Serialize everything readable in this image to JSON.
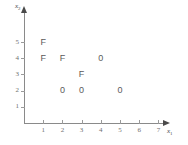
{
  "chart_data": {
    "type": "scatter",
    "title": "",
    "xlabel": "x1",
    "ylabel": "x2",
    "xlim": [
      0,
      7.6
    ],
    "ylim": [
      0,
      5.8
    ],
    "grid": false,
    "legend": "none",
    "x_ticks": [
      "1",
      "2",
      "3",
      "4",
      "5",
      "6",
      "7"
    ],
    "y_ticks": [
      "1",
      "2",
      "3",
      "4",
      "5"
    ],
    "x_tick_values": [
      1,
      2,
      3,
      4,
      5,
      6,
      7
    ],
    "y_tick_values": [
      1,
      2,
      3,
      4,
      5
    ],
    "series": [
      {
        "name": "F",
        "marker_label": "F",
        "points": [
          {
            "x": 1,
            "y": 5
          },
          {
            "x": 1,
            "y": 4
          },
          {
            "x": 2,
            "y": 4
          },
          {
            "x": 3,
            "y": 3
          }
        ]
      },
      {
        "name": "0",
        "marker_label": "0",
        "points": [
          {
            "x": 4,
            "y": 4
          },
          {
            "x": 2,
            "y": 2
          },
          {
            "x": 3,
            "y": 2
          },
          {
            "x": 5,
            "y": 2
          }
        ]
      }
    ],
    "points": [
      {
        "x": 1,
        "y": 5,
        "label": "F"
      },
      {
        "x": 1,
        "y": 4,
        "label": "F"
      },
      {
        "x": 2,
        "y": 4,
        "label": "F"
      },
      {
        "x": 4,
        "y": 4,
        "label": "0"
      },
      {
        "x": 3,
        "y": 3,
        "label": "F"
      },
      {
        "x": 2,
        "y": 2,
        "label": "0"
      },
      {
        "x": 3,
        "y": 2,
        "label": "0"
      },
      {
        "x": 5,
        "y": 2,
        "label": "0"
      }
    ]
  },
  "axes": {
    "x_name_base": "x",
    "x_name_sub": "1",
    "y_name_base": "x",
    "y_name_sub": "2"
  },
  "colors": {
    "axis": "#8a8a8a",
    "tick": "#9a9a9a",
    "text": "#6f6f6f",
    "marker": "#5a5a5a",
    "background": "#ffffff"
  }
}
